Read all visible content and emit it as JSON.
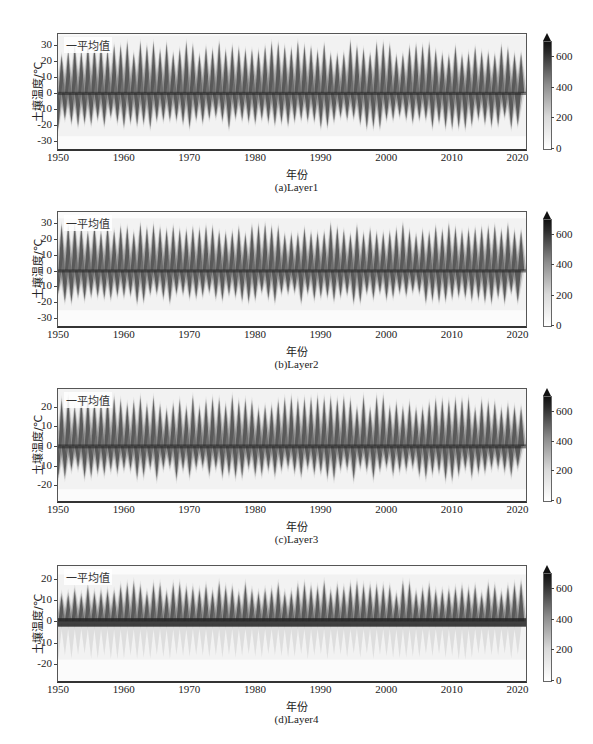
{
  "figure": {
    "legend_label": "一平均值",
    "ylabel": "土壤温度/℃",
    "xlabel": "年份",
    "colorbar": {
      "ticks": [
        "0",
        "200",
        "400",
        "600"
      ],
      "range": [
        0,
        700
      ],
      "extend": "max",
      "colormap": "Greys"
    }
  },
  "panels": [
    {
      "caption": "(a)Layer1",
      "yticks": [
        "30",
        "20",
        "10",
        "0",
        "-10",
        "-20",
        "-30"
      ]
    },
    {
      "caption": "(b)Layer2",
      "yticks": [
        "30",
        "20",
        "10",
        "0",
        "-10",
        "-20",
        "-30"
      ]
    },
    {
      "caption": "(c)Layer3",
      "yticks": [
        "20",
        "10",
        "0",
        "-10",
        "-20"
      ]
    },
    {
      "caption": "(d)Layer4",
      "yticks": [
        "20",
        "10",
        "0",
        "-10",
        "-20"
      ]
    }
  ],
  "xticks": [
    "1950",
    "1960",
    "1970",
    "1980",
    "1990",
    "2000",
    "2010",
    "2020"
  ],
  "chart_data": [
    {
      "type": "heatmap",
      "title": "(a)Layer1",
      "xlabel": "年份",
      "ylabel": "土壤温度/℃",
      "x_range": [
        1950,
        2021
      ],
      "ylim": [
        -35,
        37
      ],
      "x_ticks": [
        1950,
        1960,
        1970,
        1980,
        1990,
        2000,
        2010,
        2020
      ],
      "y_ticks": [
        -30,
        -20,
        -10,
        0,
        10,
        20,
        30
      ],
      "series": [
        {
          "name": "平均值",
          "description": "annual cycle of mean soil temperature, ~72 oscillations",
          "peak_max": 32,
          "trough_min": -22,
          "mean_level": 0
        }
      ],
      "colorbar": {
        "ticks": [
          0,
          200,
          400,
          600
        ],
        "max": 700
      },
      "legend": [
        "一平均值"
      ],
      "legend_position": "upper left"
    },
    {
      "type": "heatmap",
      "title": "(b)Layer2",
      "xlabel": "年份",
      "ylabel": "土壤温度/℃",
      "x_range": [
        1950,
        2021
      ],
      "ylim": [
        -35,
        37
      ],
      "x_ticks": [
        1950,
        1960,
        1970,
        1980,
        1990,
        2000,
        2010,
        2020
      ],
      "y_ticks": [
        -30,
        -20,
        -10,
        0,
        10,
        20,
        30
      ],
      "series": [
        {
          "name": "平均值",
          "peak_max": 29,
          "trough_min": -20,
          "mean_level": 0
        }
      ],
      "colorbar": {
        "ticks": [
          0,
          200,
          400,
          600
        ],
        "max": 700
      },
      "legend": [
        "一平均值"
      ],
      "legend_position": "upper left"
    },
    {
      "type": "heatmap",
      "title": "(c)Layer3",
      "xlabel": "年份",
      "ylabel": "土壤温度/℃",
      "x_range": [
        1950,
        2021
      ],
      "ylim": [
        -28,
        29
      ],
      "x_ticks": [
        1950,
        1960,
        1970,
        1980,
        1990,
        2000,
        2010,
        2020
      ],
      "y_ticks": [
        -20,
        -10,
        0,
        10,
        20
      ],
      "series": [
        {
          "name": "平均值",
          "peak_max": 25,
          "trough_min": -17,
          "mean_level": 0
        }
      ],
      "colorbar": {
        "ticks": [
          0,
          200,
          400,
          600
        ],
        "max": 700
      },
      "legend": [
        "一平均值"
      ],
      "legend_position": "upper left"
    },
    {
      "type": "heatmap",
      "title": "(d)Layer4",
      "xlabel": "年份",
      "ylabel": "土壤温度/℃",
      "x_range": [
        1950,
        2021
      ],
      "ylim": [
        -28,
        26
      ],
      "x_ticks": [
        1950,
        1960,
        1970,
        1980,
        1990,
        2000,
        2010,
        2020
      ],
      "y_ticks": [
        -20,
        -10,
        0,
        10,
        20
      ],
      "series": [
        {
          "name": "平均值",
          "peak_max": 18,
          "trough_min": -3,
          "mean_level": 0,
          "note": "dense band near 0 with faint spread down to about -15"
        }
      ],
      "colorbar": {
        "ticks": [
          0,
          200,
          400,
          600
        ],
        "max": 700
      },
      "legend": [
        "一平均值"
      ],
      "legend_position": "upper left"
    }
  ]
}
